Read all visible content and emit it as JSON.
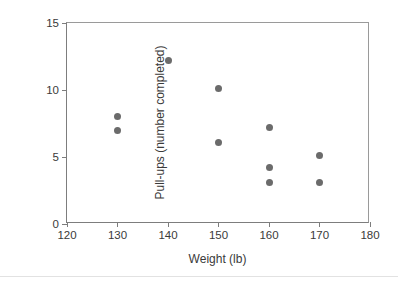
{
  "chart_data": {
    "type": "scatter",
    "title": "",
    "xlabel": "Weight (lb)",
    "ylabel": "Pull-ups (number completed)",
    "xlim": [
      120,
      180
    ],
    "ylim": [
      0,
      15
    ],
    "xticks": [
      120,
      130,
      140,
      150,
      160,
      170,
      180
    ],
    "yticks": [
      0,
      5,
      10,
      15
    ],
    "xticklabels": [
      "120",
      "130",
      "140",
      "150",
      "160",
      "170",
      "180"
    ],
    "yticklabels": [
      "0",
      "5",
      "10",
      "15"
    ],
    "grid": false,
    "legend": null,
    "marker_color": "#6b6b6b",
    "marker_shape": "circle",
    "series": [
      {
        "name": "Pull-ups vs Weight",
        "points": [
          {
            "x": 130,
            "y": 8.0
          },
          {
            "x": 130,
            "y": 7.0
          },
          {
            "x": 140,
            "y": 12.2
          },
          {
            "x": 150,
            "y": 10.1
          },
          {
            "x": 150,
            "y": 6.1
          },
          {
            "x": 160,
            "y": 7.2
          },
          {
            "x": 160,
            "y": 4.2
          },
          {
            "x": 160,
            "y": 3.1
          },
          {
            "x": 170,
            "y": 5.1
          },
          {
            "x": 170,
            "y": 3.1
          }
        ]
      }
    ]
  }
}
